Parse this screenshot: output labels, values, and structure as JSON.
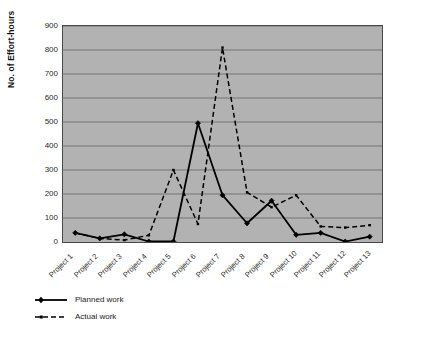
{
  "chart_data": {
    "type": "line",
    "title": "",
    "xlabel": "",
    "ylabel": "No. of Effort-hours",
    "categories": [
      "Project 1",
      "Project 2",
      "Project 3",
      "Project 4",
      "Project 5",
      "Project 6",
      "Project 7",
      "Project 8",
      "Project 9",
      "Project 10",
      "Project 11",
      "Project 12",
      "Project 13"
    ],
    "series": [
      {
        "name": "Planned work",
        "style": "solid",
        "marker": "diamond",
        "color": "#000000",
        "values": [
          38,
          15,
          32,
          2,
          2,
          495,
          195,
          78,
          172,
          30,
          38,
          2,
          22
        ]
      },
      {
        "name": "Actual work",
        "style": "dashed",
        "marker": "small-square",
        "color": "#000000",
        "values": [
          38,
          15,
          8,
          28,
          300,
          75,
          810,
          207,
          145,
          195,
          65,
          60,
          70
        ]
      }
    ],
    "ylim": [
      0,
      900
    ],
    "ytick_values": [
      0,
      100,
      200,
      300,
      400,
      500,
      600,
      700,
      800,
      900
    ],
    "ytick_labels": [
      "0",
      "100",
      "200",
      "300",
      "400",
      "500",
      "600",
      "700",
      "800",
      "900"
    ],
    "grid": true,
    "grid_axis": "y",
    "legend_position": "below-axis-left",
    "plot_background": "#b2b2b2",
    "page_background": "#ffffff",
    "axis_color": "#4a4a4a",
    "gridline_color": "#6e6e6e"
  },
  "legend": {
    "items": [
      {
        "label": "Planned work",
        "style": "solid"
      },
      {
        "label": "Actual work",
        "style": "dashed"
      }
    ]
  }
}
